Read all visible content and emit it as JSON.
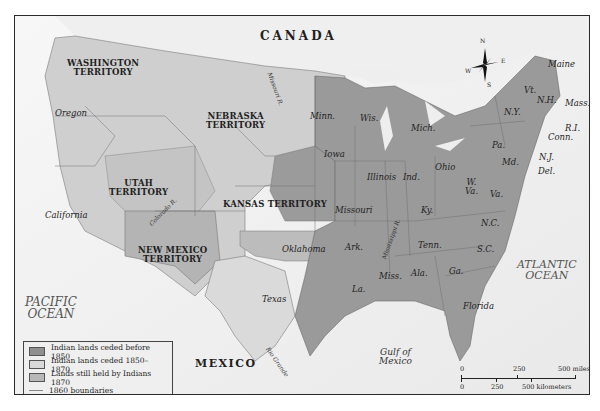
{
  "map": {
    "country_labels": {
      "canada": "CANADA",
      "mexico": "MEXICO"
    },
    "water_labels": {
      "pacific": [
        "PACIFIC",
        "OCEAN"
      ],
      "atlantic": [
        "ATLANTIC",
        "OCEAN"
      ],
      "gulf": [
        "Gulf of",
        "Mexico"
      ]
    },
    "territories": [
      {
        "id": "washington",
        "lines": [
          "WASHINGTON",
          "TERRITORY"
        ]
      },
      {
        "id": "nebraska",
        "lines": [
          "NEBRASKA",
          "TERRITORY"
        ]
      },
      {
        "id": "utah",
        "lines": [
          "UTAH",
          "TERRITORY"
        ]
      },
      {
        "id": "kansas",
        "lines": [
          "KANSAS TERRITORY"
        ]
      },
      {
        "id": "new-mexico",
        "lines": [
          "NEW MEXICO",
          "TERRITORY"
        ]
      }
    ],
    "states": {
      "oregon": "Oregon",
      "california": "California",
      "texas": "Texas",
      "oklahoma": "Oklahoma",
      "minn": "Minn.",
      "wis": "Wis.",
      "mich": "Mich.",
      "iowa": "Iowa",
      "illinois": "Illinois",
      "ind": "Ind.",
      "ohio": "Ohio",
      "missouri": "Missouri",
      "ky": "Ky.",
      "tenn": "Tenn.",
      "ark": "Ark.",
      "la": "La.",
      "miss": "Miss.",
      "ala": "Ala.",
      "ga": "Ga.",
      "florida": "Florida",
      "sc": "S.C.",
      "nc": "N.C.",
      "va": "Va.",
      "wva": [
        "W.",
        "Va."
      ],
      "md": "Md.",
      "del": "Del.",
      "nj": "N.J.",
      "pa": "Pa.",
      "ny": "N.Y.",
      "conn": "Conn.",
      "ri": "R.I.",
      "mass": "Mass.",
      "nh": "N.H.",
      "vt": "Vt.",
      "maine": "Maine"
    },
    "rivers": {
      "missouri": "Missouri R.",
      "colorado": "Colorado R.",
      "mississippi": "Mississippi R.",
      "rio_grande": "Rio Grande"
    },
    "compass": {
      "n": "N",
      "s": "S",
      "e": "E",
      "w": "W"
    }
  },
  "legend": {
    "items": [
      {
        "label": "Indian lands ceded before 1850",
        "color": "#8f8f8f",
        "type": "swatch"
      },
      {
        "label": "Indian lands ceded 1850–1870",
        "color": "#d9d9d9",
        "type": "swatch"
      },
      {
        "label": "Lands still held by Indians 1870",
        "color": "#b8b8b8",
        "type": "swatch"
      },
      {
        "label": "1860 boundaries",
        "color": "#888888",
        "type": "line"
      }
    ]
  },
  "scale_bar": {
    "miles": {
      "ticks": [
        "0",
        "250",
        "500 miles"
      ]
    },
    "kilometers": {
      "ticks": [
        "0",
        "250",
        "500 kilometers"
      ]
    }
  },
  "colors": {
    "ceded_before_1850": "#8f8f8f",
    "ceded_1850_1870": "#d9d9d9",
    "held_1870": "#b8b8b8",
    "water": "#f4f4f4",
    "boundary": "#666666"
  }
}
